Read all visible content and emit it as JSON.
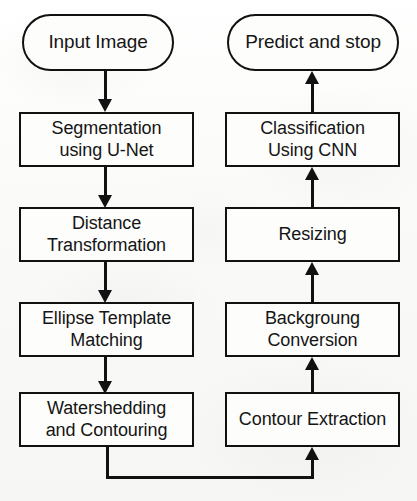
{
  "diagram": {
    "type": "flowchart",
    "orientation": "two-column; left column flows top-to-bottom, right column flows bottom-to-top",
    "stroke_color": "#111111",
    "node_fill_color": "#fdfdfc",
    "background_color": "#fbfbfa"
  },
  "nodes": {
    "input_image": {
      "label": "Input Image",
      "shape": "stadium",
      "column": "left"
    },
    "segmentation": {
      "label": "Segmentation\nusing U-Net",
      "shape": "rectangle",
      "column": "left"
    },
    "distance_transformation": {
      "label": "Distance\nTransformation",
      "shape": "rectangle",
      "column": "left"
    },
    "ellipse_template_matching": {
      "label": "Ellipse Template\nMatching",
      "shape": "rectangle",
      "column": "left"
    },
    "watershedding": {
      "label": "Watershedding\nand Contouring",
      "shape": "rectangle",
      "column": "left"
    },
    "contour_extraction": {
      "label": "Contour Extraction",
      "shape": "rectangle",
      "column": "right"
    },
    "background_conversion": {
      "label": "Backgroung\nConversion",
      "shape": "rectangle",
      "column": "right"
    },
    "resizing": {
      "label": "Resizing",
      "shape": "rectangle",
      "column": "right"
    },
    "classification": {
      "label": "Classification\nUsing CNN",
      "shape": "rectangle",
      "column": "right"
    },
    "predict_and_stop": {
      "label": "Predict and stop",
      "shape": "stadium",
      "column": "right"
    }
  },
  "edges": [
    {
      "from": "input_image",
      "to": "segmentation",
      "direction": "down"
    },
    {
      "from": "segmentation",
      "to": "distance_transformation",
      "direction": "down"
    },
    {
      "from": "distance_transformation",
      "to": "ellipse_template_matching",
      "direction": "down"
    },
    {
      "from": "ellipse_template_matching",
      "to": "watershedding",
      "direction": "down"
    },
    {
      "from": "watershedding",
      "to": "contour_extraction",
      "direction": "right-then-up",
      "routing": "down, across bottom, up"
    },
    {
      "from": "contour_extraction",
      "to": "background_conversion",
      "direction": "up"
    },
    {
      "from": "background_conversion",
      "to": "resizing",
      "direction": "up"
    },
    {
      "from": "resizing",
      "to": "classification",
      "direction": "up"
    },
    {
      "from": "classification",
      "to": "predict_and_stop",
      "direction": "up"
    }
  ],
  "caption": ""
}
